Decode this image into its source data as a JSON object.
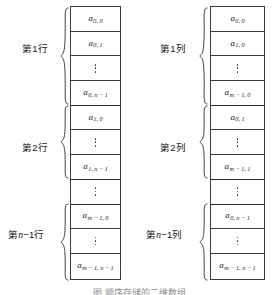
{
  "figure": {
    "caption": "图  顺序存储的二维数组",
    "panels": [
      {
        "id": "row-major",
        "groups": [
          {
            "label_prefix": "第",
            "label_index": "1",
            "label_suffix": "行",
            "label_italic": ""
          },
          {
            "label_prefix": "第",
            "label_index": "2",
            "label_suffix": "行",
            "label_italic": ""
          },
          {
            "label_prefix": "第",
            "label_index": "",
            "label_suffix": "−1行",
            "label_italic": "n"
          }
        ],
        "cells": [
          {
            "type": "term",
            "base": "a",
            "sub": "0, 0",
            "group_end": false
          },
          {
            "type": "term",
            "base": "a",
            "sub": "0, 1",
            "group_end": false
          },
          {
            "type": "dots",
            "base": "",
            "sub": "",
            "group_end": false
          },
          {
            "type": "term",
            "base": "a",
            "sub": "0, n − 1",
            "group_end": true
          },
          {
            "type": "term",
            "base": "a",
            "sub": "1, 0",
            "group_end": false
          },
          {
            "type": "dots",
            "base": "",
            "sub": "",
            "group_end": false
          },
          {
            "type": "term",
            "base": "a",
            "sub": "1, n − 1",
            "group_end": true
          },
          {
            "type": "dots",
            "base": "",
            "sub": "",
            "group_end": true
          },
          {
            "type": "term",
            "base": "a",
            "sub": "m − 1, 0",
            "group_end": false
          },
          {
            "type": "dots",
            "base": "",
            "sub": "",
            "group_end": false
          },
          {
            "type": "term",
            "base": "a",
            "sub": "m − 1, n − 1",
            "group_end": false
          }
        ]
      },
      {
        "id": "column-major",
        "groups": [
          {
            "label_prefix": "第",
            "label_index": "1",
            "label_suffix": "列",
            "label_italic": ""
          },
          {
            "label_prefix": "第",
            "label_index": "2",
            "label_suffix": "列",
            "label_italic": ""
          },
          {
            "label_prefix": "第",
            "label_index": "",
            "label_suffix": "−1列",
            "label_italic": "n"
          }
        ],
        "cells": [
          {
            "type": "term",
            "base": "a",
            "sub": "0, 0",
            "group_end": false
          },
          {
            "type": "term",
            "base": "a",
            "sub": "1, 0",
            "group_end": false
          },
          {
            "type": "dots",
            "base": "",
            "sub": "",
            "group_end": false
          },
          {
            "type": "term",
            "base": "a",
            "sub": "m − 1, 0",
            "group_end": true
          },
          {
            "type": "term",
            "base": "a",
            "sub": "0, 1",
            "group_end": false
          },
          {
            "type": "dots",
            "base": "",
            "sub": "",
            "group_end": false
          },
          {
            "type": "term",
            "base": "a",
            "sub": "m − 1, 1",
            "group_end": true
          },
          {
            "type": "dots",
            "base": "",
            "sub": "",
            "group_end": true
          },
          {
            "type": "term",
            "base": "a",
            "sub": "0, n − 1",
            "group_end": false
          },
          {
            "type": "dots",
            "base": "",
            "sub": "",
            "group_end": false
          },
          {
            "type": "term",
            "base": "a",
            "sub": "m − 1, n − 1",
            "group_end": false
          }
        ]
      }
    ]
  },
  "colors": {
    "cell_border": "#3b3b3b",
    "text": "#141414",
    "background": "#ffffff"
  }
}
